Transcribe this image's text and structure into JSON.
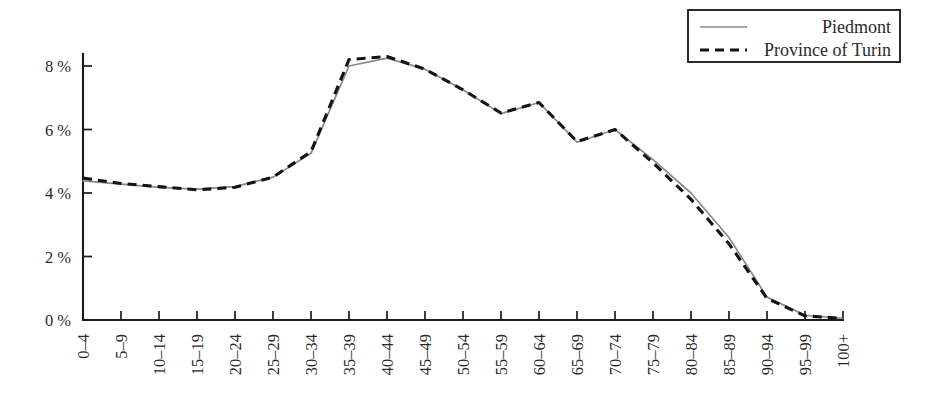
{
  "chart_data": {
    "type": "line",
    "title": "",
    "subtitle": "",
    "xlabel": "",
    "ylabel": "",
    "categories": [
      "0–4",
      "5–9",
      "10–14",
      "15–19",
      "20–24",
      "25–29",
      "30–34",
      "35–39",
      "40–44",
      "45–49",
      "50–54",
      "55–59",
      "60–64",
      "65–69",
      "70–74",
      "75–79",
      "80–84",
      "85–89",
      "90–94",
      "95–99",
      "100+"
    ],
    "series": [
      {
        "name": "Piedmont",
        "style": "solid",
        "color": "#8a8a8a",
        "values": [
          4.38,
          4.28,
          4.18,
          4.12,
          4.2,
          4.5,
          5.25,
          8.0,
          8.25,
          7.9,
          7.25,
          6.5,
          6.85,
          5.6,
          6.0,
          5.05,
          4.0,
          2.6,
          0.72,
          0.15,
          0.05
        ]
      },
      {
        "name": "Province of Turin",
        "style": "dashed",
        "color": "#141414",
        "values": [
          4.47,
          4.3,
          4.2,
          4.1,
          4.18,
          4.5,
          5.3,
          8.2,
          8.3,
          7.9,
          7.25,
          6.52,
          6.85,
          5.62,
          6.0,
          4.95,
          3.8,
          2.4,
          0.68,
          0.13,
          0.05
        ]
      }
    ],
    "yticks": [
      {
        "value": 0,
        "label": "0 %"
      },
      {
        "value": 2,
        "label": "2 %"
      },
      {
        "value": 4,
        "label": "4 %"
      },
      {
        "value": 6,
        "label": "6 %"
      },
      {
        "value": 8,
        "label": "8 %"
      }
    ],
    "ylim": [
      0,
      8.75
    ],
    "xlim": [
      0,
      20
    ],
    "grid": false,
    "legend_position": "top-right",
    "legend_entries": [
      "Piedmont",
      "Province of Turin"
    ],
    "axis_color": "#1a1a1a"
  }
}
